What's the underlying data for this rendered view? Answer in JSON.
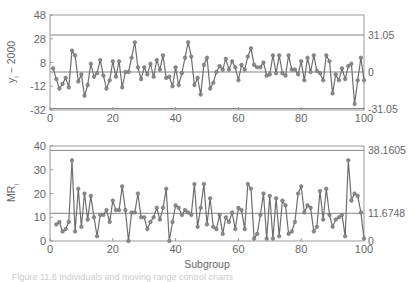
{
  "chart_data": [
    {
      "type": "line",
      "title": "",
      "xlabel": "",
      "ylabel": "y_i − 2000",
      "xlim": [
        0,
        100
      ],
      "ylim": [
        -32,
        48
      ],
      "x_ticks": [
        "0",
        "20",
        "40",
        "60",
        "80",
        "100"
      ],
      "y_ticks": [
        "48",
        "28",
        "8",
        "-12",
        "-32"
      ],
      "reference_lines": [
        {
          "name": "UCL",
          "value": 31.05,
          "label": "31.05"
        },
        {
          "name": "CL",
          "value": 0,
          "label": "0"
        },
        {
          "name": "LCL",
          "value": -31.05,
          "label": "-31.05"
        }
      ],
      "grid": false,
      "series": [
        {
          "name": "y_i - 2000",
          "x": [
            1,
            2,
            3,
            4,
            5,
            6,
            7,
            8,
            9,
            10,
            11,
            12,
            13,
            14,
            15,
            16,
            17,
            18,
            19,
            20,
            21,
            22,
            23,
            24,
            25,
            26,
            27,
            28,
            29,
            30,
            31,
            32,
            33,
            34,
            35,
            36,
            37,
            38,
            39,
            40,
            41,
            42,
            43,
            44,
            45,
            46,
            47,
            48,
            49,
            50,
            51,
            52,
            53,
            54,
            55,
            56,
            57,
            58,
            59,
            60,
            61,
            62,
            63,
            64,
            65,
            66,
            67,
            68,
            69,
            70,
            71,
            72,
            73,
            74,
            75,
            76,
            77,
            78,
            79,
            80,
            81,
            82,
            83,
            84,
            85,
            86,
            87,
            88,
            89,
            90,
            91,
            92,
            93,
            94,
            95,
            96,
            97,
            98,
            99,
            100
          ],
          "values": [
            3,
            -6,
            -14,
            -10,
            -5,
            -13,
            18,
            14,
            -8,
            -2,
            -20,
            -11,
            7,
            -4,
            -1,
            10,
            -3,
            -14,
            -7,
            9,
            -4,
            9,
            -13,
            0,
            0,
            12,
            25,
            4,
            -6,
            4,
            -2,
            7,
            -4,
            10,
            2,
            14,
            -5,
            -4,
            -12,
            4,
            -11,
            -1,
            12,
            25,
            13,
            -11,
            -5,
            -19,
            6,
            12,
            -14,
            -9,
            0,
            5,
            2,
            11,
            2,
            9,
            4,
            -7,
            6,
            2,
            13,
            20,
            6,
            4,
            4,
            8,
            -3,
            -2,
            14,
            -1,
            14,
            -1,
            -3,
            14,
            2,
            2,
            -2,
            9,
            -7,
            12,
            0,
            14,
            1,
            -1,
            -7,
            14,
            9,
            -18,
            -2,
            -7,
            3,
            -6,
            5,
            7,
            -27,
            -7,
            12,
            -7,
            1
          ]
        }
      ]
    },
    {
      "type": "line",
      "title": "",
      "xlabel": "Subgroup",
      "ylabel": "MR_i",
      "xlim": [
        0,
        100
      ],
      "ylim": [
        0,
        40
      ],
      "x_ticks": [
        "0",
        "20",
        "40",
        "60",
        "80",
        "100"
      ],
      "y_ticks": [
        "40",
        "30",
        "20",
        "10",
        "0"
      ],
      "reference_lines": [
        {
          "name": "UCL",
          "value": 38.1605,
          "label": "38.1605"
        },
        {
          "name": "CL",
          "value": 11.6748,
          "label": "11.6748"
        },
        {
          "name": "LCL",
          "value": 0,
          "label": "0"
        }
      ],
      "grid": false,
      "series": [
        {
          "name": "MR_i",
          "x": [
            2,
            3,
            4,
            5,
            6,
            7,
            8,
            9,
            10,
            11,
            12,
            13,
            14,
            15,
            16,
            17,
            18,
            19,
            20,
            21,
            22,
            23,
            24,
            25,
            26,
            27,
            28,
            29,
            30,
            31,
            32,
            33,
            34,
            35,
            36,
            37,
            38,
            39,
            40,
            41,
            42,
            43,
            44,
            45,
            46,
            47,
            48,
            49,
            50,
            51,
            52,
            53,
            54,
            55,
            56,
            57,
            58,
            59,
            60,
            61,
            62,
            63,
            64,
            65,
            66,
            67,
            68,
            69,
            70,
            71,
            72,
            73,
            74,
            75,
            76,
            77,
            78,
            79,
            80,
            81,
            82,
            83,
            84,
            85,
            86,
            87,
            88,
            89,
            90,
            91,
            92,
            93,
            94,
            95,
            96,
            97,
            98,
            99,
            100
          ],
          "values": [
            7,
            8,
            4,
            5,
            8,
            34,
            4,
            22,
            6,
            20,
            9,
            19,
            10,
            2,
            11,
            11,
            13,
            8,
            17,
            13,
            13,
            23,
            13,
            0,
            12,
            12,
            20,
            10,
            10,
            5,
            8,
            10,
            14,
            9,
            14,
            22,
            0,
            8,
            15,
            14,
            11,
            13,
            12,
            11,
            24,
            6,
            14,
            24,
            7,
            18,
            6,
            5,
            11,
            3,
            10,
            8,
            12,
            5,
            14,
            13,
            5,
            24,
            22,
            1,
            3,
            11,
            20,
            1,
            19,
            1,
            18,
            2,
            17,
            15,
            3,
            4,
            8,
            20,
            23,
            12,
            15,
            14,
            4,
            6,
            21,
            9,
            22,
            11,
            6,
            9,
            10,
            11,
            2,
            34,
            17,
            20,
            19,
            12,
            1
          ]
        }
      ]
    }
  ],
  "labels": {
    "top_ylabel": "y",
    "top_ylabel_sub": "i",
    "top_ylabel_rest": " − 2000",
    "bottom_ylabel": "MR",
    "bottom_ylabel_sub": "i",
    "xlabel": "Subgroup",
    "top_ticks": [
      "48",
      "28",
      "8",
      "-12",
      "-32"
    ],
    "bottom_ticks": [
      "40",
      "30",
      "20",
      "10",
      "0"
    ],
    "x_ticks": [
      "0",
      "20",
      "40",
      "60",
      "80",
      "100"
    ],
    "top_right": [
      "31.05",
      "0",
      "-31.05"
    ],
    "bottom_right": [
      "38.1605",
      "11.6748",
      "0"
    ],
    "caption": "Figure 11.8  Individuals and moving range control charts"
  },
  "colors": {
    "line": "#6e6e6e",
    "marker": "#8a8a8a",
    "frame": "#9a9a9a",
    "ref": "#777777"
  }
}
